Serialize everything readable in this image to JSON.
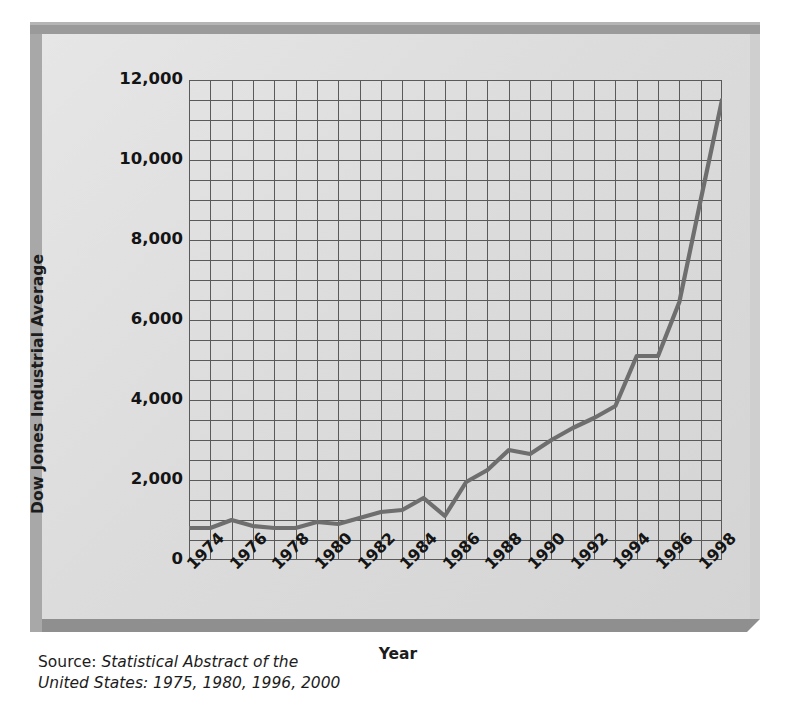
{
  "figure": {
    "y_axis_title": "Dow Jones Industrial Average",
    "x_axis_title": "Year",
    "source_label": "Source:",
    "source_italic_line1": "Statistical Abstract of the",
    "source_italic_line2": "United States: 1975, 1980, 1996, 2000"
  },
  "colors": {
    "panel_background": "#dcdcdc",
    "frame_shadow": "#9a9a9a",
    "grid_line": "#5a5a5a",
    "data_line": "#6e6e6e",
    "text": "#141414"
  },
  "chart_data": {
    "type": "line",
    "title": "",
    "xlabel": "Year",
    "ylabel": "Dow Jones Industrial Average",
    "xlim": [
      1974,
      1999
    ],
    "ylim": [
      0,
      12000
    ],
    "grid": true,
    "legend": "none",
    "y_tick_labels": [
      "12,000",
      "10,000",
      "8,000",
      "6,000",
      "4,000",
      "2,000",
      "0"
    ],
    "y_ticks": [
      12000,
      10000,
      8000,
      6000,
      4000,
      2000,
      0
    ],
    "y_minor_gridline_step": 500,
    "x_tick_labels": [
      "1974",
      "1976",
      "1978",
      "1980",
      "1982",
      "1984",
      "1986",
      "1988",
      "1990",
      "1992",
      "1994",
      "1996",
      "1998"
    ],
    "x_ticks": [
      1974,
      1976,
      1978,
      1980,
      1982,
      1984,
      1986,
      1988,
      1990,
      1992,
      1994,
      1996,
      1998
    ],
    "x_minor_gridline_step": 1,
    "x_tick_rotation_deg": -45,
    "series": [
      {
        "name": "Dow Jones Industrial Average",
        "x": [
          1974,
          1975,
          1976,
          1977,
          1978,
          1979,
          1980,
          1981,
          1982,
          1983,
          1984,
          1985,
          1986,
          1987,
          1988,
          1989,
          1990,
          1991,
          1992,
          1993,
          1994,
          1995,
          1996,
          1997,
          1998,
          1999
        ],
        "values": [
          800,
          800,
          1000,
          850,
          800,
          800,
          950,
          900,
          1050,
          1200,
          1250,
          1550,
          1100,
          1950,
          2250,
          2750,
          2650,
          3000,
          3300,
          3550,
          3850,
          5100,
          5100,
          6450,
          9000,
          11500
        ]
      }
    ]
  }
}
